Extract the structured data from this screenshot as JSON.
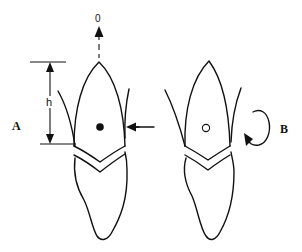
{
  "figure": {
    "panels": [
      {
        "id": "A",
        "label": "A",
        "force_label": "0",
        "height_label": "h",
        "center_marker": "filled-dot",
        "applied_force": "horizontal arrow pointing left at crown"
      },
      {
        "id": "B",
        "label": "B",
        "center_marker": "open-circle",
        "applied_force": "rotational moment arrow"
      }
    ],
    "colors": {
      "line": "#111111",
      "background": "#ffffff"
    }
  }
}
